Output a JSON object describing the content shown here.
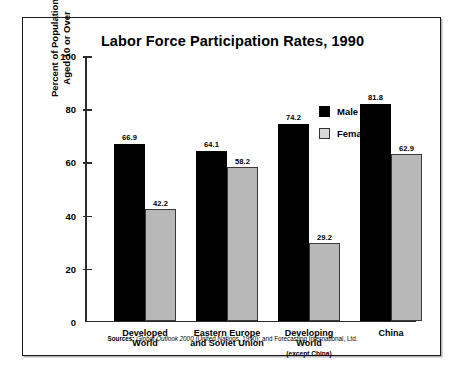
{
  "chart_data": {
    "type": "bar",
    "title": "Labor Force Participation Rates, 1990",
    "xlabel": "",
    "ylabel": "Percent of Population\nAged 10 or Over",
    "ylim": [
      0,
      100
    ],
    "yticks": [
      0,
      20,
      40,
      60,
      80,
      100
    ],
    "ytick_labels": [
      "0",
      "20",
      "40",
      "60",
      "80",
      "100"
    ],
    "grid": false,
    "legend_position": "right-inside-top",
    "categories": [
      {
        "line1": "Developed",
        "line2": "World",
        "line3": ""
      },
      {
        "line1": "Eastern Europe",
        "line2": "and Soviet Union",
        "line3": ""
      },
      {
        "line1": "Developing",
        "line2": "World",
        "line3": "(except China)"
      },
      {
        "line1": "China",
        "line2": "",
        "line3": ""
      }
    ],
    "series": [
      {
        "name": "Male",
        "color": "#000000",
        "values": [
          66.9,
          64.1,
          74.2,
          81.8
        ],
        "value_labels": [
          "66.9",
          "64.1",
          "74.2",
          "81.8"
        ]
      },
      {
        "name": "Female",
        "color": "#b8b8b8",
        "values": [
          42.2,
          58.2,
          29.2,
          62.9
        ],
        "value_labels": [
          "42.2",
          "58.2",
          "29.2",
          "62.9"
        ]
      }
    ],
    "source": {
      "lead": "Sources:",
      "italic_part": "Global Outlook 2000",
      "rest": " (United Nations, 1990); and Forecasting International, Ltd."
    }
  }
}
